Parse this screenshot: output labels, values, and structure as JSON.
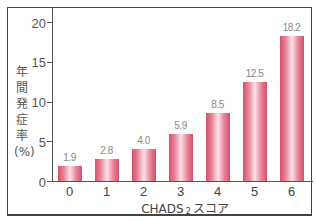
{
  "chart_data": {
    "type": "bar",
    "title": "",
    "xlabel": "CHADS₂スコア",
    "xlabel_main": "CHADS",
    "xlabel_sub": "2",
    "xlabel_suffix": "スコア",
    "ylabel": "年間発症率(%)",
    "categories": [
      "0",
      "1",
      "2",
      "3",
      "4",
      "5",
      "6"
    ],
    "values": [
      1.9,
      2.8,
      4.0,
      5.9,
      8.5,
      12.5,
      18.2
    ],
    "value_labels": [
      "1.9",
      "2.8",
      "4.0",
      "5.9",
      "8.5",
      "12.5",
      "18.2"
    ],
    "yticks": [
      "0",
      "5",
      "10",
      "15",
      "20"
    ],
    "ylim": [
      0,
      20
    ],
    "grid": false,
    "legend": null,
    "bar_color": "#d45068",
    "bar_highlight": "#fbe2e8"
  }
}
